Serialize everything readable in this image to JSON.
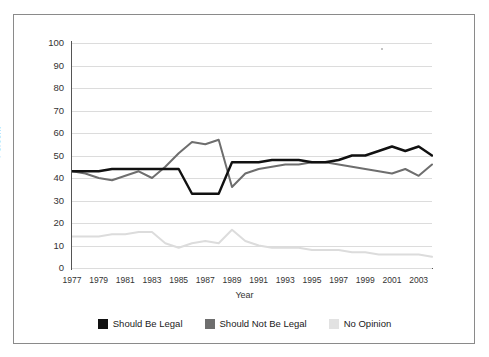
{
  "chart_data": {
    "type": "line",
    "title": "",
    "xlabel": "Year",
    "ylabel": "Percent",
    "xlim": [
      1977,
      2004
    ],
    "ylim": [
      0,
      100
    ],
    "grid": true,
    "legend_position": "bottom",
    "x": [
      1977,
      1978,
      1979,
      1980,
      1981,
      1982,
      1983,
      1984,
      1985,
      1986,
      1987,
      1988,
      1989,
      1990,
      1991,
      1992,
      1993,
      1994,
      1995,
      1996,
      1997,
      1998,
      1999,
      2000,
      2001,
      2002,
      2003,
      2004
    ],
    "xticks": [
      "1977",
      "1979",
      "1981",
      "1983",
      "1985",
      "1987",
      "1989",
      "1991",
      "1993",
      "1995",
      "1997",
      "1999",
      "2001",
      "2003"
    ],
    "yticks": [
      "0",
      "10",
      "20",
      "30",
      "40",
      "50",
      "60",
      "70",
      "80",
      "90",
      "100"
    ],
    "series": [
      {
        "name": "Should Be Legal",
        "color": "#111111",
        "values": [
          43,
          43,
          43,
          44,
          44,
          44,
          44,
          44,
          44,
          33,
          33,
          33,
          47,
          47,
          47,
          48,
          48,
          48,
          47,
          47,
          48,
          50,
          50,
          52,
          54,
          52,
          54,
          50
        ]
      },
      {
        "name": "Should Not Be Legal",
        "color": "#6e6e6e",
        "values": [
          43,
          42,
          40,
          39,
          41,
          43,
          40,
          45,
          51,
          56,
          55,
          57,
          36,
          42,
          44,
          45,
          46,
          46,
          47,
          47,
          46,
          45,
          44,
          43,
          42,
          44,
          41,
          46
        ]
      },
      {
        "name": "No Opinion",
        "color": "#dcdcdc",
        "values": [
          14,
          14,
          14,
          15,
          15,
          16,
          16,
          11,
          9,
          11,
          12,
          11,
          17,
          12,
          10,
          9,
          9,
          9,
          8,
          8,
          8,
          7,
          7,
          6,
          6,
          6,
          6,
          5
        ]
      }
    ]
  },
  "legend": {
    "items": [
      {
        "label": "Should Be Legal",
        "color": "#111111"
      },
      {
        "label": "Should Not Be Legal",
        "color": "#6e6e6e"
      },
      {
        "label": "No Opinion",
        "color": "#e2e2e2"
      }
    ]
  }
}
